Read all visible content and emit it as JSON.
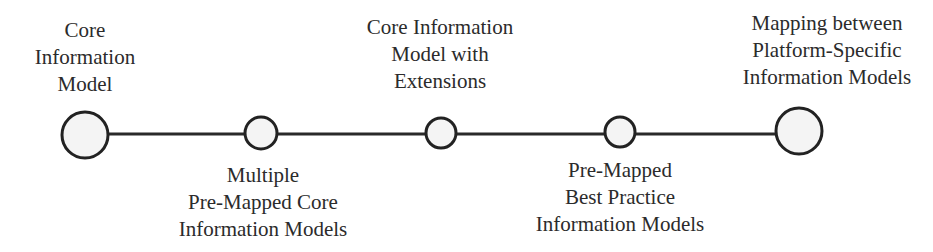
{
  "diagram": {
    "type": "timeline",
    "line": {
      "y": 134,
      "x_start": 85,
      "x_end": 799,
      "color": "#2a2a2a",
      "width": 3
    },
    "nodes": [
      {
        "id": "core-information-model",
        "cx": 85,
        "cy": 135,
        "r": 23,
        "label_position": "above",
        "label_lines": [
          "Core",
          "Information",
          "Model"
        ]
      },
      {
        "id": "multiple-pre-mapped-core-information-models",
        "cx": 261,
        "cy": 133,
        "r": 16,
        "label_position": "below",
        "label_lines": [
          "Multiple",
          "Pre-Mapped Core",
          "Information Models"
        ]
      },
      {
        "id": "core-information-model-with-extensions",
        "cx": 441,
        "cy": 133,
        "r": 15,
        "label_position": "above",
        "label_lines": [
          "Core Information",
          "Model with",
          "Extensions"
        ]
      },
      {
        "id": "pre-mapped-best-practice-information-models",
        "cx": 620,
        "cy": 132,
        "r": 15,
        "label_position": "below",
        "label_lines": [
          "Pre-Mapped",
          "Best Practice",
          "Information Models"
        ]
      },
      {
        "id": "mapping-between-platform-specific-information-models",
        "cx": 799,
        "cy": 131,
        "r": 23,
        "label_position": "above",
        "label_lines": [
          "Mapping between",
          "Platform-Specific",
          "Information Models"
        ]
      }
    ],
    "colors": {
      "stroke": "#222222",
      "fill": "#f4f4f4",
      "text": "#2b2b2b",
      "background": "#ffffff"
    }
  }
}
